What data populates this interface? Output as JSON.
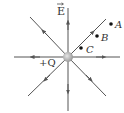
{
  "diagram": {
    "charge": {
      "label": "+Q",
      "x": 68,
      "y": 57,
      "color": "#b0b0b0"
    },
    "field_label": "E",
    "line_color": "#555555",
    "field_lines": [
      {
        "name": "up",
        "dx": 0,
        "dy": -1
      },
      {
        "name": "down",
        "dx": 0,
        "dy": 1
      },
      {
        "name": "left",
        "dx": -1,
        "dy": 0
      },
      {
        "name": "right",
        "dx": 1,
        "dy": 0
      },
      {
        "name": "up-right",
        "dx": 1,
        "dy": -1
      },
      {
        "name": "up-left",
        "dx": -1,
        "dy": -1
      },
      {
        "name": "down-right",
        "dx": 1,
        "dy": 1
      },
      {
        "name": "down-left",
        "dx": -1,
        "dy": 1
      }
    ],
    "points": [
      {
        "label": "A",
        "x": 111,
        "y": 24
      },
      {
        "label": "B",
        "x": 97,
        "y": 36
      },
      {
        "label": "C",
        "x": 81,
        "y": 48
      }
    ]
  }
}
